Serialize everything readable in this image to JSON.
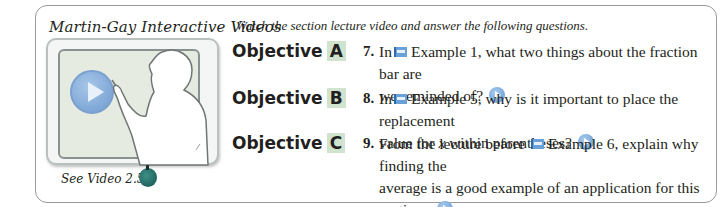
{
  "panel": {
    "brand_title": "Martin-Gay Interactive Videos",
    "instructions": "Watch the section lecture video and answer the following questions.",
    "video": {
      "play_icon": "play-icon",
      "caption": "See Video 2.5",
      "caption_icon": "apple-icon"
    }
  },
  "objectives": [
    {
      "label": "Objective",
      "letter": "A",
      "number": "7.",
      "text_before": "In",
      "flag_icon": "video-flag-icon",
      "text_line1": "Example 1, what two things about the fraction bar are",
      "text_line2": "we reminded of?",
      "play_icon": "play-icon"
    },
    {
      "label": "Objective",
      "letter": "B",
      "number": "8.",
      "text_before": "In",
      "flag_icon": "video-flag-icon",
      "text_line1": "Example 5, why is it important to place the replacement",
      "text_line2_a": "value for",
      "text_line2_var": "x",
      "text_line2_b": "within parentheses?",
      "play_icon": "play-icon"
    },
    {
      "label": "Objective",
      "letter": "C",
      "number": "9.",
      "text_before": "From the lecture before",
      "flag_icon": "video-flag-icon",
      "text_line1": "Example 6, explain why finding the",
      "text_line2": "average is a good example of an application for this section.",
      "play_icon": "play-icon"
    }
  ]
}
